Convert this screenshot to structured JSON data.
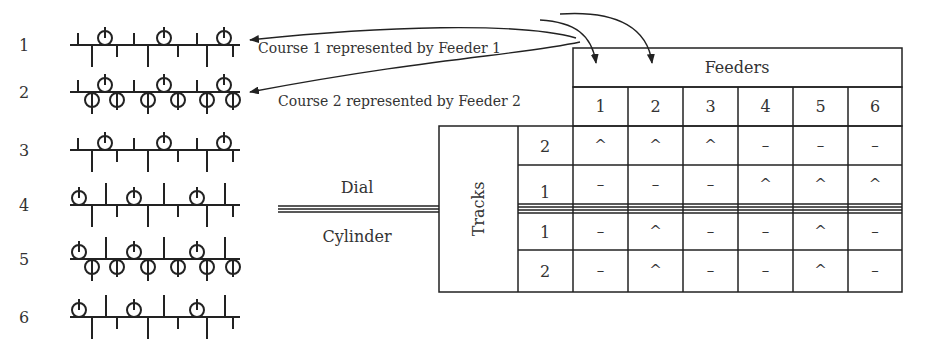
{
  "courses": [
    {
      "label": "1",
      "y": 45,
      "needles_up": [
        [
          78,
          12
        ],
        [
          134,
          12
        ],
        [
          197,
          12
        ]
      ],
      "loops_up": [
        105,
        164,
        224
      ],
      "loops_down": [],
      "ticks_down": [
        [
          92,
          22
        ],
        [
          117,
          12
        ],
        [
          148,
          22
        ],
        [
          178,
          12
        ],
        [
          207,
          22
        ],
        [
          233,
          12
        ]
      ]
    },
    {
      "label": "2",
      "y": 92,
      "needles_up": [
        [
          78,
          12
        ],
        [
          134,
          12
        ],
        [
          197,
          12
        ]
      ],
      "loops_up": [
        105,
        164,
        224
      ],
      "loops_down": [
        92,
        117,
        148,
        178,
        207,
        233
      ],
      "ticks_down": [
        [
          92,
          22
        ],
        [
          117,
          10
        ],
        [
          148,
          22
        ],
        [
          178,
          10
        ],
        [
          207,
          22
        ],
        [
          233,
          10
        ]
      ]
    },
    {
      "label": "3",
      "y": 150,
      "needles_up": [
        [
          78,
          12
        ],
        [
          134,
          12
        ],
        [
          197,
          12
        ]
      ],
      "loops_up": [
        105,
        164,
        224
      ],
      "loops_down": [],
      "ticks_down": [
        [
          92,
          22
        ],
        [
          117,
          12
        ],
        [
          148,
          22
        ],
        [
          178,
          12
        ],
        [
          207,
          22
        ],
        [
          233,
          12
        ]
      ]
    },
    {
      "label": "4",
      "y": 205,
      "needles_up": [
        [
          106,
          22
        ],
        [
          164,
          22
        ],
        [
          225,
          22
        ]
      ],
      "loops_up": [
        79,
        134,
        197
      ],
      "loops_down": [],
      "ticks_down": [
        [
          92,
          22
        ],
        [
          117,
          12
        ],
        [
          148,
          22
        ],
        [
          178,
          12
        ],
        [
          207,
          22
        ],
        [
          233,
          12
        ]
      ]
    },
    {
      "label": "5",
      "y": 259,
      "needles_up": [
        [
          106,
          22
        ],
        [
          164,
          22
        ],
        [
          225,
          22
        ]
      ],
      "loops_up": [
        79,
        134,
        197
      ],
      "loops_down": [
        92,
        117,
        148,
        178,
        207,
        233
      ],
      "ticks_down": [
        [
          92,
          22
        ],
        [
          117,
          10
        ],
        [
          148,
          22
        ],
        [
          178,
          10
        ],
        [
          207,
          22
        ],
        [
          233,
          10
        ]
      ]
    },
    {
      "label": "6",
      "y": 317,
      "needles_up": [
        [
          106,
          22
        ],
        [
          164,
          22
        ],
        [
          225,
          22
        ]
      ],
      "loops_up": [
        79,
        134,
        197
      ],
      "loops_down": [],
      "ticks_down": [
        [
          92,
          22
        ],
        [
          117,
          12
        ],
        [
          148,
          22
        ],
        [
          178,
          12
        ],
        [
          207,
          22
        ],
        [
          233,
          12
        ]
      ]
    }
  ],
  "annotations": {
    "course1": "Course 1 represented by Feeder 1",
    "course2": "Course 2 represented by Feeder 2"
  },
  "labels": {
    "dial": "Dial",
    "cylinder": "Cylinder",
    "tracks": "Tracks",
    "feeders": "Feeders"
  },
  "table": {
    "feeder_numbers": [
      "1",
      "2",
      "3",
      "4",
      "5",
      "6"
    ],
    "rows": [
      {
        "section": "dial",
        "track": "2",
        "cells": [
          "^",
          "^",
          "^",
          "–",
          "–",
          "–"
        ]
      },
      {
        "section": "dial",
        "track": "1",
        "cells": [
          "–",
          "–",
          "–",
          "^",
          "^",
          "^"
        ]
      },
      {
        "section": "cylinder",
        "track": "1",
        "cells": [
          "–",
          "^",
          "–",
          "–",
          "^",
          "–"
        ]
      },
      {
        "section": "cylinder",
        "track": "2",
        "cells": [
          "–",
          "^",
          "–",
          "–",
          "^",
          "–"
        ]
      }
    ]
  },
  "colors": {
    "ink": "#222222",
    "text": "#333333",
    "background": "#ffffff"
  }
}
